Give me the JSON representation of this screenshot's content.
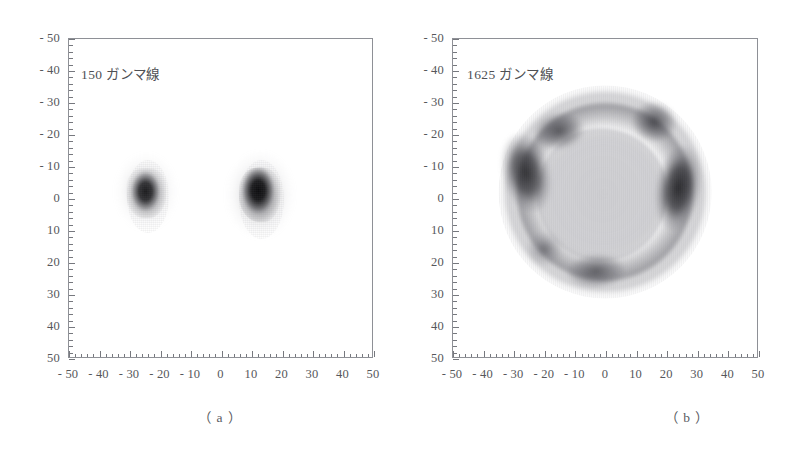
{
  "figure": {
    "panels": [
      {
        "id": "a",
        "note": "150 ガンマ線",
        "caption": "（ a ）"
      },
      {
        "id": "b",
        "note": "1625 ガンマ線",
        "caption": "（ b ）"
      }
    ]
  },
  "axes": {
    "y_ticks": [
      "50",
      "40",
      "30",
      "20",
      "10",
      "0",
      "- 10",
      "- 20",
      "- 30",
      "- 40",
      "- 50"
    ],
    "x_ticks": [
      "- 50",
      "- 40",
      "- 30",
      "- 20",
      "- 10",
      "0",
      "10",
      "20",
      "30",
      "40",
      "50"
    ]
  },
  "chart_data": [
    {
      "type": "scatter",
      "title": "150 ガンマ線",
      "subtitle": "（ a ）",
      "xlabel": "",
      "ylabel": "",
      "xlim": [
        -50,
        50
      ],
      "ylim": [
        -50,
        50
      ],
      "xtick_values": [
        -50,
        -40,
        -30,
        -20,
        -10,
        0,
        10,
        20,
        30,
        40,
        50
      ],
      "ytick_values": [
        -50,
        -40,
        -30,
        -20,
        -10,
        0,
        10,
        20,
        30,
        40,
        50
      ],
      "minor_tick_step": 2,
      "grid": false,
      "legend": "none",
      "total_events": 150,
      "clusters": [
        {
          "name": "left-blob",
          "center_x": -22,
          "center_y": 0,
          "radius_x": 7,
          "radius_y": 9,
          "peak_density": 0.8
        },
        {
          "name": "right-blob",
          "center_x": 18,
          "center_y": 0,
          "radius_x": 8,
          "radius_y": 10,
          "peak_density": 1.0
        }
      ]
    },
    {
      "type": "scatter",
      "title": "1625 ガンマ線",
      "subtitle": "（ b ）",
      "xlabel": "",
      "ylabel": "",
      "xlim": [
        -50,
        50
      ],
      "ylim": [
        -50,
        50
      ],
      "xtick_values": [
        -50,
        -40,
        -30,
        -20,
        -10,
        0,
        10,
        20,
        30,
        40,
        50
      ],
      "ytick_values": [
        -50,
        -40,
        -30,
        -20,
        -10,
        0,
        10,
        20,
        30,
        40,
        50
      ],
      "minor_tick_step": 2,
      "grid": false,
      "legend": "none",
      "total_events": 1625,
      "clusters": [
        {
          "name": "outer-ring",
          "center_x": 0,
          "center_y": 1,
          "radius_x": 33,
          "radius_y": 32,
          "peak_density": 0.4
        },
        {
          "name": "inner-core",
          "center_x": -1,
          "center_y": 0,
          "radius_x": 21,
          "radius_y": 21,
          "peak_density": 0.42
        },
        {
          "name": "left-lobe",
          "center_x": -25,
          "center_y": 8,
          "radius_x": 8,
          "radius_y": 13,
          "peak_density": 0.88
        },
        {
          "name": "right-lobe",
          "center_x": 24,
          "center_y": 2,
          "radius_x": 8,
          "radius_y": 14,
          "peak_density": 0.92
        },
        {
          "name": "top-left-lobe",
          "center_x": -15,
          "center_y": 21,
          "radius_x": 9,
          "radius_y": 6,
          "peak_density": 0.72
        },
        {
          "name": "top-right-lobe",
          "center_x": 16,
          "center_y": 24,
          "radius_x": 8,
          "radius_y": 7,
          "peak_density": 0.74
        },
        {
          "name": "bottom-lobe",
          "center_x": -3,
          "center_y": -22,
          "radius_x": 10,
          "radius_y": 6,
          "peak_density": 0.66
        },
        {
          "name": "bottom-left-lobe",
          "center_x": -20,
          "center_y": -16,
          "radius_x": 6,
          "radius_y": 6,
          "peak_density": 0.52
        }
      ]
    }
  ]
}
